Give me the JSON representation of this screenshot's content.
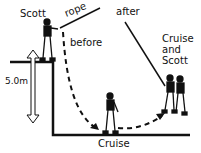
{
  "labels": {
    "scott": "Scott",
    "rope": "rope",
    "before": "before",
    "after": "after",
    "cruise_and_scott": [
      "Cruise",
      "and",
      "Scott"
    ],
    "height": "5.0m",
    "cruise": "Cruise"
  },
  "colors": {
    "ink": "#111111",
    "background": "#ffffff"
  }
}
